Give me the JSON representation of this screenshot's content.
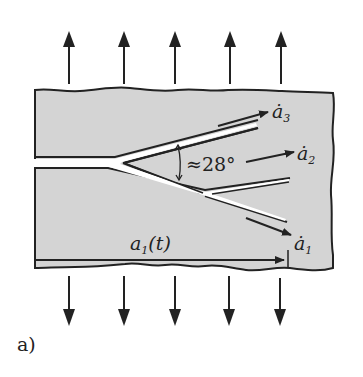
{
  "figure": {
    "panel_label": "a)",
    "angle_label": "≈28°",
    "crack_length_label": "a",
    "crack_length_sub": "1",
    "crack_length_arg": "(t)",
    "velocities": [
      {
        "symbol": "ȧ",
        "sub": "3"
      },
      {
        "symbol": "ȧ",
        "sub": "2"
      },
      {
        "symbol": "ȧ",
        "sub": "1"
      }
    ],
    "load_arrows_top_count": 5,
    "load_arrows_bottom_count": 5
  },
  "colors": {
    "plate_fill": "#d4d4d4",
    "stroke": "#222222",
    "crack": "#ffffff",
    "background": "#ffffff"
  }
}
